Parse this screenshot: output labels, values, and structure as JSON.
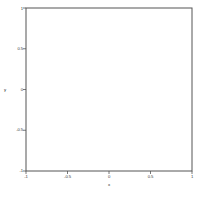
{
  "chart_data": {
    "type": "quiver",
    "title": "",
    "subtitle": "",
    "xlabel": "x",
    "ylabel": "y",
    "xlim": [
      -1,
      1
    ],
    "ylim": [
      -1,
      1
    ],
    "xticks": [
      -1,
      -0.5,
      0,
      0.5,
      1
    ],
    "xticklabels": [
      "-1",
      "-0.5",
      "0",
      "0.5",
      "1"
    ],
    "yticks": [
      -1,
      -0.5,
      0,
      0.5,
      1
    ],
    "yticklabels": [
      "-1",
      "-0.5",
      "0",
      "0.5",
      "1"
    ],
    "grid": false,
    "legend": null,
    "annotations": [],
    "field": {
      "description": "Counter-clockwise rotational vector field (vortex) centred near the origin; arrow magnitude grows with radius then saturates.",
      "u_formula": "-y",
      "v_formula": "x",
      "center": [
        0.0,
        0.0
      ],
      "grid_nx": 24,
      "grid_ny": 24,
      "arrow_color": "#1a1a1a",
      "arrow_scale": 0.055,
      "rotation": "counter-clockwise"
    },
    "style": {
      "axes_color": "#555555",
      "background": "#ffffff",
      "border_width": 1
    }
  },
  "figure": {
    "plot_left": 26,
    "plot_top": 8,
    "plot_right": 192,
    "plot_bottom": 171
  }
}
